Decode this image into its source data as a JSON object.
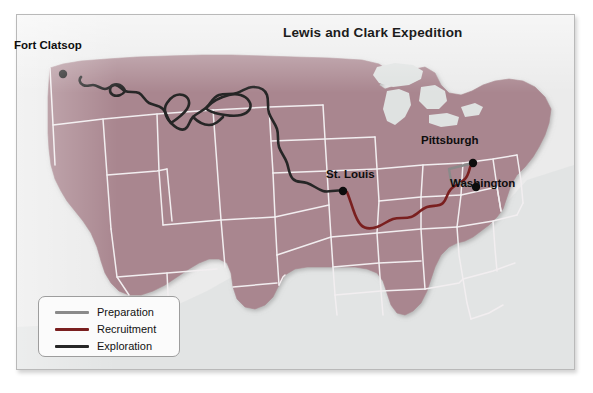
{
  "map": {
    "title": "Lewis and Clark Expedition",
    "colors": {
      "panel_background": "#ebebeb",
      "panel_border": "#b9b9b9",
      "land_fill": "#a9868f",
      "state_border": "#f2eef0",
      "water": "#dfe2e1",
      "preparation": "#8a8a8a",
      "recruitment": "#7a1f1f",
      "exploration": "#262626",
      "marker": "#0d0d0d",
      "label_text": "#0d0d0d"
    },
    "cities": [
      {
        "name": "Fort Clatsop",
        "label": "Fort Clatsop"
      },
      {
        "name": "St. Louis",
        "label": "St. Louis"
      },
      {
        "name": "Pittsburgh",
        "label": "Pittsburgh"
      },
      {
        "name": "Washington",
        "label": "Washington"
      }
    ],
    "legend": {
      "items": [
        {
          "label": "Preparation",
          "color": "#8a8a8a"
        },
        {
          "label": "Recruitment",
          "color": "#7a1f1f"
        },
        {
          "label": "Exploration",
          "color": "#262626"
        }
      ]
    },
    "routes": [
      {
        "name": "Preparation",
        "from": "Pittsburgh",
        "to": "Washington",
        "color": "#8a8a8a"
      },
      {
        "name": "Recruitment",
        "from": "Pittsburgh",
        "to": "St. Louis",
        "color": "#7a1f1f"
      },
      {
        "name": "Exploration",
        "from": "St. Louis",
        "to": "Fort Clatsop",
        "color": "#262626"
      }
    ]
  }
}
